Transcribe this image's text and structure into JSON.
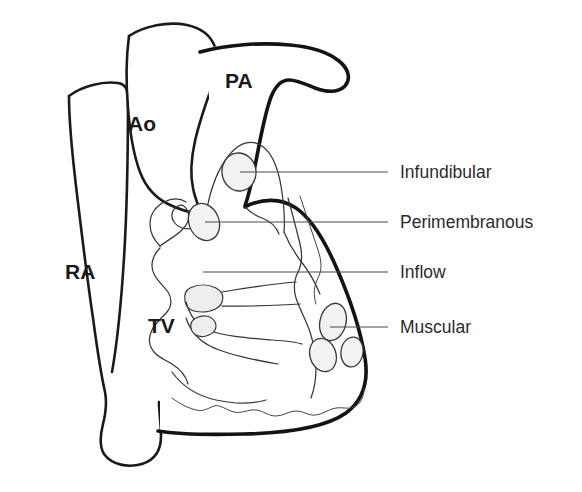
{
  "figure": {
    "background_color": "#ffffff",
    "ink_color": "#15130f",
    "defect_fill_color": "#f2f2f0",
    "leader_color": "#4a4a4a"
  },
  "anatomic_labels": [
    {
      "id": "pa",
      "text": "PA",
      "x": 225,
      "y": 88,
      "name": "label-pulmonary-artery"
    },
    {
      "id": "ao",
      "text": "Ao",
      "x": 128,
      "y": 131,
      "name": "label-aorta"
    },
    {
      "id": "ra",
      "text": "RA",
      "x": 65,
      "y": 279,
      "name": "label-right-atrium"
    },
    {
      "id": "tv",
      "text": "TV",
      "x": 148,
      "y": 333,
      "name": "label-tricuspid-valve"
    }
  ],
  "callouts": [
    {
      "id": "infundibular",
      "text": "Infundibular",
      "label_x": 400,
      "label_y": 178,
      "leader_x1": 240,
      "leader_x2": 388,
      "leader_y": 172,
      "defect": {
        "cx": 239,
        "cy": 172,
        "rx": 17,
        "ry": 19,
        "rotate": -8
      }
    },
    {
      "id": "perimembranous",
      "text": "Perimembranous",
      "label_x": 400,
      "label_y": 228,
      "leader_x1": 205,
      "leader_x2": 388,
      "leader_y": 222,
      "defect": {
        "cx": 204,
        "cy": 222,
        "rx": 15,
        "ry": 19,
        "rotate": -22
      }
    },
    {
      "id": "inflow",
      "text": "Inflow",
      "label_x": 400,
      "label_y": 278,
      "leader_x1": 203,
      "leader_x2": 388,
      "leader_y": 272,
      "defect": {
        "cx": 206,
        "cy": 272,
        "rx": 16,
        "ry": 12,
        "rotate": 0
      }
    },
    {
      "id": "muscular",
      "text": "Muscular",
      "label_x": 400,
      "label_y": 333,
      "leader_x1": 330,
      "leader_x2": 388,
      "leader_y": 327,
      "defect": {
        "cx": 333,
        "cy": 322,
        "rx": 13,
        "ry": 19,
        "rotate": 14
      }
    }
  ],
  "muscular_defect_cluster": [
    {
      "cx": 333,
      "cy": 322,
      "rx": 13,
      "ry": 19,
      "rotate": 14
    },
    {
      "cx": 323,
      "cy": 355,
      "rx": 13,
      "ry": 17,
      "rotate": -18
    },
    {
      "cx": 352,
      "cy": 352,
      "rx": 11,
      "ry": 15,
      "rotate": 8
    }
  ],
  "structure_names": {
    "right_atrium": "right-atrium-outline",
    "aorta": "aorta-outline",
    "pulmonary_artery": "pulmonary-artery-outline",
    "right_ventricle": "right-ventricle-free-wall",
    "septum": "interventricular-septum",
    "tricuspid_valve": "tricuspid-valve-apparatus",
    "trabeculations": "apical-trabeculations"
  }
}
